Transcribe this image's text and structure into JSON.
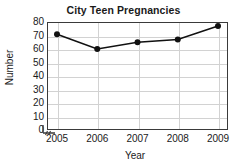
{
  "chart_data": {
    "type": "line",
    "title": "City Teen Pregnancies",
    "xlabel": "Year",
    "ylabel": "Number",
    "categories": [
      "2005",
      "2006",
      "2007",
      "2008",
      "2009"
    ],
    "x": [
      2005,
      2006,
      2007,
      2008,
      2009
    ],
    "values": [
      71,
      60,
      65,
      67,
      77
    ],
    "ylim": [
      0,
      80
    ],
    "ytick_labels": [
      "0",
      "10",
      "20",
      "30",
      "40",
      "50",
      "60",
      "70",
      "80"
    ],
    "yticks": [
      0,
      10,
      20,
      30,
      40,
      50,
      60,
      70,
      80
    ],
    "grid": "horizontal-and-vertical",
    "legend": "none",
    "axis_break": "x-axis-break-near-origin",
    "series": [
      {
        "name": "City Teen Pregnancies",
        "values": [
          71,
          60,
          65,
          67,
          77
        ]
      }
    ],
    "colors": {
      "line": "#111111",
      "marker": "#111111",
      "grid": "#d2d2d2",
      "frame": "#3a3a3a",
      "background": "#ffffff",
      "text": "#1a1a1a"
    }
  }
}
